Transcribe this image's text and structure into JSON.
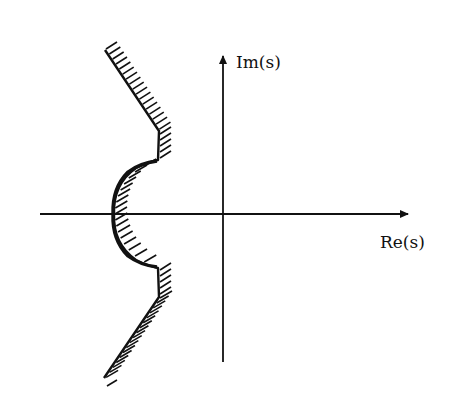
{
  "diagram": {
    "type": "complex-plane region boundary (stability region)",
    "axes": {
      "x_label": "Re(s)",
      "y_label": "Im(s)"
    },
    "colors": {
      "line": "#111111",
      "background": "#ffffff"
    },
    "boundary": {
      "description": "Contour in left half-plane: sloped lines, short vertical segments, and a semicircular arc bulging left around the real axis; hatching on the right side indicates the region",
      "hatching_side": "right"
    }
  }
}
